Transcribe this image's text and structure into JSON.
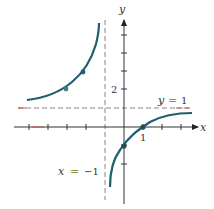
{
  "figure": {
    "function": "y = (x - 1)/(x + 1)",
    "axis_labels": {
      "x": "x",
      "y": "y"
    },
    "tick_labels": {
      "x_one": "1",
      "y_two": "2"
    },
    "asymptotes": {
      "horizontal": {
        "label_var": "y",
        "label_eq": "=",
        "label_val": "1",
        "value": 1
      },
      "vertical": {
        "label_var": "x",
        "label_eq": "=",
        "label_val": "−1",
        "value": -1
      }
    },
    "marked_points": [
      {
        "x": -3,
        "y": 2
      },
      {
        "x": -2,
        "y": 3
      },
      {
        "x": 0,
        "y": -1
      },
      {
        "x": 1,
        "y": 0
      }
    ],
    "colors": {
      "curve": "#1f5f6e",
      "axis": "#333333",
      "asymptote": "#777777",
      "asymptote_accent": "#c0504d",
      "equals_sign": "#8a9a3a"
    }
  }
}
